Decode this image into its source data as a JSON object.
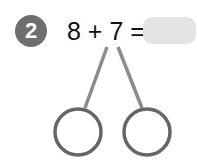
{
  "problem": {
    "number": "2",
    "expression": "8 + 7 =",
    "answer_value": ""
  },
  "number_bond": {
    "left_part": "",
    "right_part": ""
  },
  "colors": {
    "badge": "#6e6e6e",
    "answer_box": "#e4e4e4",
    "lines": "#8c8c8c",
    "circles": "#666666"
  }
}
